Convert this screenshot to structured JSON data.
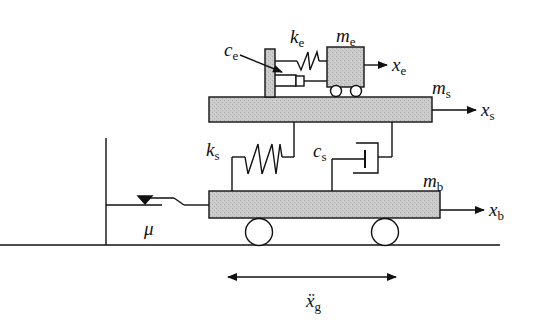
{
  "diagram": {
    "title": "",
    "components": {
      "equipment_mass": {
        "symbol": "m",
        "sub": "e"
      },
      "equipment_stiffness": {
        "symbol": "k",
        "sub": "e"
      },
      "equipment_damping": {
        "symbol": "c",
        "sub": "e"
      },
      "equipment_displacement": {
        "symbol": "x",
        "sub": "e"
      },
      "structure_mass": {
        "symbol": "m",
        "sub": "s"
      },
      "structure_displacement": {
        "symbol": "x",
        "sub": "s"
      },
      "structure_stiffness": {
        "symbol": "k",
        "sub": "s"
      },
      "structure_damping": {
        "symbol": "c",
        "sub": "s"
      },
      "base_mass": {
        "symbol": "m",
        "sub": "b"
      },
      "base_displacement": {
        "symbol": "x",
        "sub": "b"
      },
      "friction": {
        "symbol": "μ"
      },
      "ground_acceleration": {
        "symbol": "ẍ",
        "sub": "g"
      }
    },
    "colors": {
      "line": "#111111",
      "mass_fill": "#c8c8c8",
      "background": "#ffffff"
    }
  }
}
